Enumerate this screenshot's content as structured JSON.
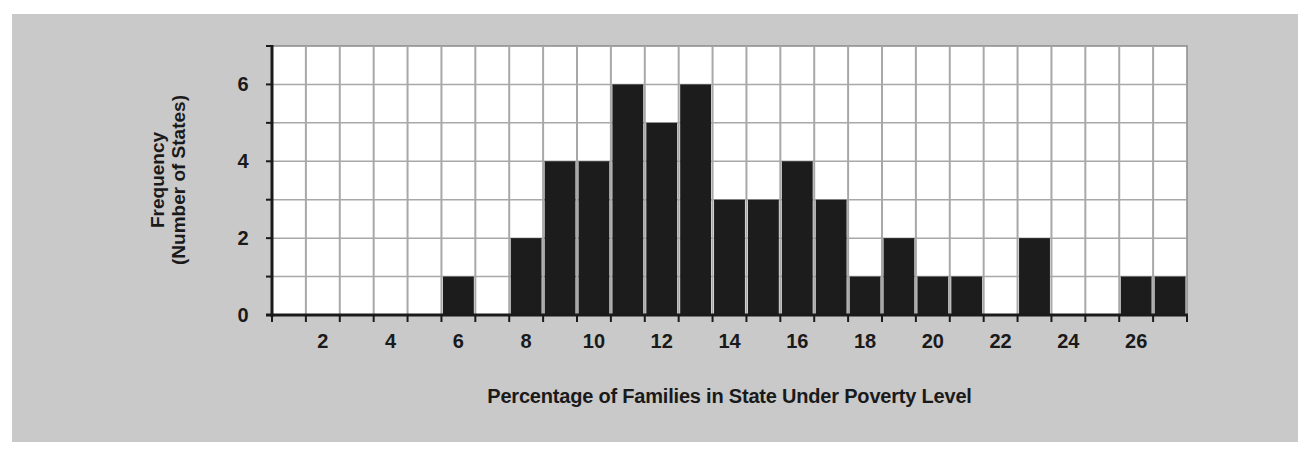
{
  "chart_data": {
    "type": "bar",
    "title": "",
    "xlabel": "Percentage of Families in State Under Poverty Level",
    "ylabel": "Frequency (Number of States)",
    "ylabel_lines": [
      "Frequency",
      "(Number of States)"
    ],
    "categories": [
      1,
      2,
      3,
      4,
      5,
      6,
      7,
      8,
      9,
      10,
      11,
      12,
      13,
      14,
      15,
      16,
      17,
      18,
      19,
      20,
      21,
      22,
      23,
      24,
      25,
      26,
      27
    ],
    "values": [
      0,
      0,
      0,
      0,
      0,
      1,
      0,
      2,
      4,
      4,
      6,
      5,
      6,
      3,
      3,
      4,
      3,
      1,
      2,
      1,
      1,
      0,
      2,
      0,
      0,
      1,
      1
    ],
    "x_tick_labels": [
      "2",
      "4",
      "6",
      "8",
      "10",
      "12",
      "14",
      "16",
      "18",
      "20",
      "22",
      "24",
      "26"
    ],
    "y_tick_labels": [
      "0",
      "2",
      "4",
      "6"
    ],
    "ylim": [
      0,
      7
    ],
    "grid": true,
    "legend": null,
    "colors": {
      "panel": "#c9c9c9",
      "plot_bg": "#ffffff",
      "bar": "#1c1c1c",
      "grid": "#a8a8a8",
      "axis": "#1a1a1a",
      "text": "#1a1a1a"
    }
  }
}
